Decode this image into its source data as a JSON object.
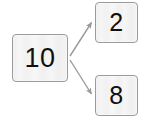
{
  "diagram": {
    "background_color": "#ffffff",
    "node_fill_color": "#f2f2f2",
    "node_border_color": "#9b9b9b",
    "node_text_color": "#101010",
    "arrow_color": "#9a9a9a",
    "nodes": [
      {
        "id": "sum",
        "label": "10",
        "role": "source"
      },
      {
        "id": "part-a",
        "label": "2",
        "role": "target"
      },
      {
        "id": "part-b",
        "label": "8",
        "role": "target"
      }
    ],
    "edges": [
      {
        "from": "10",
        "to": "2",
        "style": "arrow"
      },
      {
        "from": "10",
        "to": "8",
        "style": "arrow"
      }
    ]
  }
}
